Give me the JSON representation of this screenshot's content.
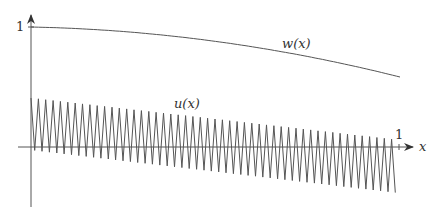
{
  "diagram": {
    "y_axis_tick_label": "1",
    "x_axis_tick_label": "1",
    "x_axis_label": "x",
    "curves": [
      {
        "name": "w",
        "label": "w(x)",
        "description": "smooth decreasing curve starting at 1"
      },
      {
        "name": "u",
        "label": "u(x)",
        "description": "rapidly oscillating sawtooth with decaying positive offset"
      }
    ],
    "oscillation_periods": 50,
    "colors": {
      "stroke": "#444444",
      "background": "#ffffff"
    }
  }
}
